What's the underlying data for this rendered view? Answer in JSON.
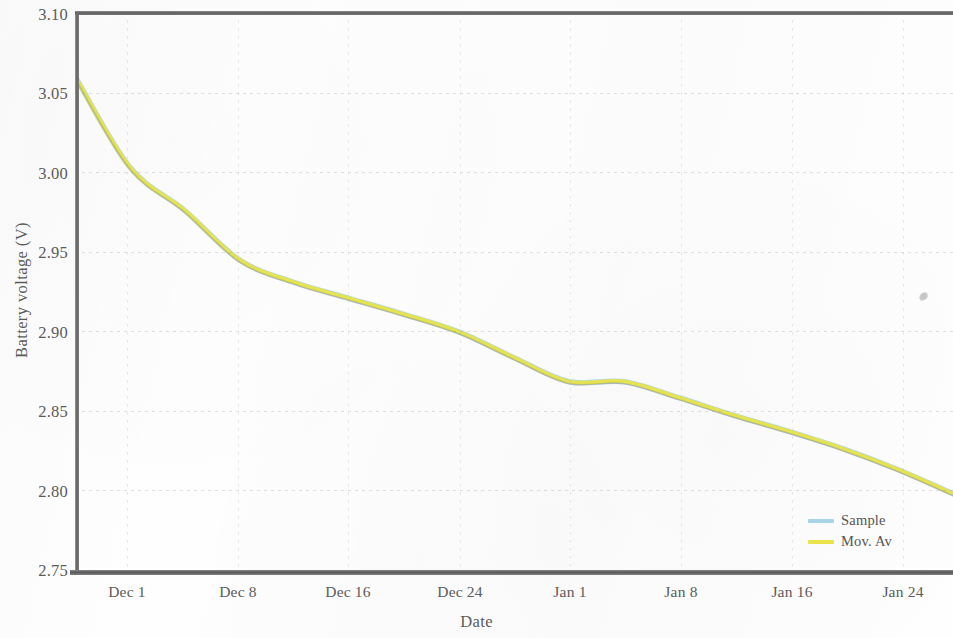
{
  "chart_data": {
    "type": "line",
    "title": "",
    "xlabel": "Date",
    "ylabel": "Battery voltage (V)",
    "ylim": [
      2.75,
      3.1
    ],
    "yticks": [
      3.1,
      3.05,
      3.0,
      2.95,
      2.9,
      2.85,
      2.8,
      2.75
    ],
    "ytick_labels": [
      "3.10",
      "3.05",
      "3.00",
      "2.95",
      "2.90",
      "2.85",
      "2.80",
      "2.75"
    ],
    "xtick_labels": [
      "Dec 1",
      "Dec 8",
      "Dec 16",
      "Dec 24",
      "Jan 1",
      "Jan 8",
      "Jan 16",
      "Jan 24"
    ],
    "grid": true,
    "legend_position": "bottom-right",
    "series": [
      {
        "name": "Sample",
        "color": "#a9d4e8",
        "x": [
          "Nov 27",
          "Dec 1",
          "Dec 4",
          "Dec 8",
          "Dec 11",
          "Dec 16",
          "Dec 20",
          "Dec 24",
          "Dec 28",
          "Jan 1",
          "Jan 4",
          "Jan 8",
          "Jan 12",
          "Jan 16",
          "Jan 20",
          "Jan 24",
          "Jan 28"
        ],
        "values": [
          3.06,
          3.003,
          2.976,
          2.945,
          2.931,
          2.921,
          2.911,
          2.9,
          2.884,
          2.869,
          2.869,
          2.859,
          2.848,
          2.838,
          2.827,
          2.814,
          2.799
        ]
      },
      {
        "name": "Mov. Av",
        "color": "#e8e44a",
        "x": [
          "Nov 27",
          "Dec 1",
          "Dec 4",
          "Dec 8",
          "Dec 11",
          "Dec 16",
          "Dec 20",
          "Dec 24",
          "Dec 28",
          "Jan 1",
          "Jan 4",
          "Jan 8",
          "Jan 12",
          "Jan 16",
          "Jan 20",
          "Jan 24",
          "Jan 28"
        ],
        "values": [
          3.06,
          3.003,
          2.976,
          2.945,
          2.931,
          2.921,
          2.911,
          2.9,
          2.884,
          2.869,
          2.869,
          2.859,
          2.848,
          2.838,
          2.827,
          2.814,
          2.799
        ]
      }
    ]
  },
  "legend": {
    "items": [
      {
        "label": "Sample",
        "color": "#a9d4e8"
      },
      {
        "label": "Mov. Av",
        "color": "#e8e44a"
      }
    ]
  },
  "axes": {
    "y_title": "Battery voltage (V)",
    "x_title": "Date"
  }
}
